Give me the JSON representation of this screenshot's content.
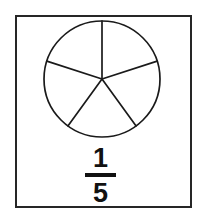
{
  "image": {
    "title": "Fraction one fifth circle model",
    "width": 201,
    "height": 218,
    "background_color": "#ffffff",
    "border_color": "#262626",
    "line_color": "#1a1a1a",
    "text_color": "#111111"
  },
  "frame": {
    "label": "diagram-border"
  },
  "diagram": {
    "shape": "circle",
    "total_parts": 5,
    "shaded_parts": 0,
    "fill": "none",
    "stroke_color": "#1a1a1a",
    "center_x": 60,
    "center_y": 60,
    "radius": 58,
    "start_angle_deg": -90,
    "sector_angle_deg": 72,
    "sector_angles_deg": [
      -90,
      -18,
      54,
      126,
      198
    ]
  },
  "fraction": {
    "numerator": "1",
    "denominator": "5",
    "value": "1/5",
    "bar_color": "#111111"
  },
  "chart_data": {
    "type": "pie",
    "title": "1/5",
    "categories": [
      "Part 1",
      "Part 2",
      "Part 3",
      "Part 4",
      "Part 5"
    ],
    "values": [
      20,
      20,
      20,
      20,
      20
    ],
    "units": "percent",
    "total_slices": 5,
    "slice_angle_deg": 72,
    "start_angle_deg": -90,
    "filled_slices": 0,
    "slice_fill": "#ffffff",
    "slice_stroke": "#1a1a1a",
    "legend": "none",
    "grid": false,
    "annotation": "1/5"
  }
}
